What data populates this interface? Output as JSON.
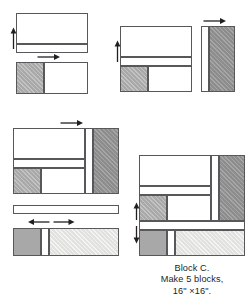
{
  "figure": {
    "caption_lines": [
      "Block C.",
      "Make 5 blocks,",
      "16\" ×16\"."
    ]
  },
  "colors": {
    "outline": "#58585a",
    "white": "#ffffff",
    "cream": "#f4f4f2",
    "light_gray": "#e4e4e2",
    "medium_gray": "#a8a8a8",
    "dark_gray": "#8f8f8f",
    "text": "#231f20"
  },
  "steps": [
    {
      "id": "step-1",
      "name": "top-left-strip-unit",
      "pieces": [
        {
          "name": "large-white-rectangle",
          "fill": "white"
        },
        {
          "name": "bottom-thin-white-strip",
          "fill": "white"
        }
      ],
      "arrows": [
        {
          "name": "press-arrow-up-left",
          "direction": "up"
        }
      ]
    },
    {
      "id": "step-2",
      "name": "top-left-two-patch-unit",
      "pieces": [
        {
          "name": "gray-hatched-square",
          "fill": "medium_gray"
        },
        {
          "name": "white-rectangle",
          "fill": "white"
        }
      ],
      "arrows": [
        {
          "name": "press-arrow-right",
          "direction": "right"
        }
      ]
    },
    {
      "id": "step-3",
      "name": "top-right-joined-unit",
      "pieces": [
        {
          "name": "upper-white-rectangle",
          "fill": "white"
        },
        {
          "name": "middle-thin-white-strip",
          "fill": "white"
        },
        {
          "name": "lower-left-gray-hatched-square",
          "fill": "medium_gray"
        },
        {
          "name": "lower-right-white-rectangle",
          "fill": "white"
        }
      ],
      "arrows": [
        {
          "name": "press-arrow-up-left",
          "direction": "up"
        }
      ]
    },
    {
      "id": "step-4",
      "name": "top-right-side-bar-unit",
      "pieces": [
        {
          "name": "narrow-white-strip",
          "fill": "white"
        },
        {
          "name": "wide-gray-hatched-bar",
          "fill": "dark_gray"
        }
      ],
      "arrows": [
        {
          "name": "press-arrow-right",
          "direction": "right"
        }
      ]
    },
    {
      "id": "step-5",
      "name": "middle-left-combined-unit",
      "pieces": [
        {
          "name": "upper-white-rectangle",
          "fill": "white"
        },
        {
          "name": "middle-thin-white-strip",
          "fill": "white"
        },
        {
          "name": "lower-left-gray-hatched-square",
          "fill": "medium_gray"
        },
        {
          "name": "lower-right-white-rectangle",
          "fill": "white"
        },
        {
          "name": "right-narrow-white-strip",
          "fill": "white"
        },
        {
          "name": "right-gray-hatched-bar",
          "fill": "dark_gray"
        }
      ],
      "arrows": [
        {
          "name": "press-arrow-right",
          "direction": "right"
        }
      ]
    },
    {
      "id": "step-6",
      "name": "bottom-left-long-white-strip",
      "pieces": [
        {
          "name": "long-thin-white-strip",
          "fill": "white"
        }
      ],
      "arrows": [
        {
          "name": "press-arrow-left",
          "direction": "left"
        },
        {
          "name": "press-arrow-right",
          "direction": "right"
        }
      ]
    },
    {
      "id": "step-7",
      "name": "bottom-left-three-patch-strip",
      "pieces": [
        {
          "name": "left-gray-square",
          "fill": "medium_gray"
        },
        {
          "name": "narrow-white-strip",
          "fill": "white"
        },
        {
          "name": "right-light-gray-rectangle",
          "fill": "light_gray"
        }
      ],
      "arrows": []
    },
    {
      "id": "step-8",
      "name": "finished-block-c",
      "pieces": [
        {
          "name": "upper-white-rectangle",
          "fill": "white"
        },
        {
          "name": "middle-thin-white-strip",
          "fill": "white"
        },
        {
          "name": "lower-left-gray-hatched-square",
          "fill": "medium_gray"
        },
        {
          "name": "lower-right-white-rectangle",
          "fill": "white"
        },
        {
          "name": "right-narrow-white-strip",
          "fill": "white"
        },
        {
          "name": "right-gray-hatched-bar",
          "fill": "dark_gray"
        },
        {
          "name": "bottom-long-white-strip",
          "fill": "white"
        },
        {
          "name": "bottom-left-gray-square",
          "fill": "medium_gray"
        },
        {
          "name": "bottom-narrow-white-strip",
          "fill": "white"
        },
        {
          "name": "bottom-right-light-gray-rectangle",
          "fill": "light_gray"
        }
      ],
      "arrows": [
        {
          "name": "press-arrow-up-left-upper",
          "direction": "up"
        },
        {
          "name": "press-arrow-down-left-lower",
          "direction": "down"
        }
      ]
    }
  ]
}
